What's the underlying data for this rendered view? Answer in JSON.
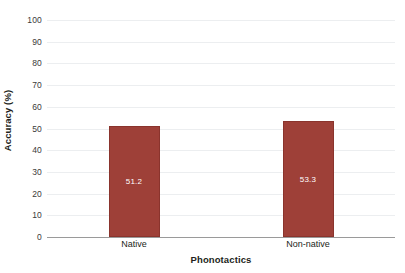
{
  "chart_data": {
    "type": "bar",
    "title": "",
    "categories": [
      "Native",
      "Non-native"
    ],
    "values": [
      51.2,
      53.3
    ],
    "value_labels": [
      "51.2",
      "53.3"
    ],
    "xlabel": "Phonotactics",
    "ylabel": "Accuracy (%)",
    "ylim": [
      0,
      100
    ],
    "y_ticks": [
      "0",
      "10",
      "20",
      "30",
      "40",
      "50",
      "60",
      "70",
      "80",
      "90",
      "100"
    ],
    "y_tick_values": [
      0,
      10,
      20,
      30,
      40,
      50,
      60,
      70,
      80,
      90,
      100
    ],
    "grid": true,
    "grid_axis": "y",
    "legend": false,
    "legend_position": "none",
    "bar_color": "#9e4038",
    "bar_border_color": "#8a342d",
    "value_label_color": "#ffffff",
    "gridline_color": "#eceef0",
    "axis_line_color": "#9a9a9a",
    "background_color": "#ffffff"
  }
}
